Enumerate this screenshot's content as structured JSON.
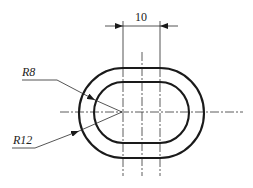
{
  "drawing": {
    "dimension_width_label": "10",
    "inner_radius_label": "R8",
    "outer_radius_label": "R12",
    "line_color": "#1a1a1a",
    "background_color": "#ffffff"
  }
}
